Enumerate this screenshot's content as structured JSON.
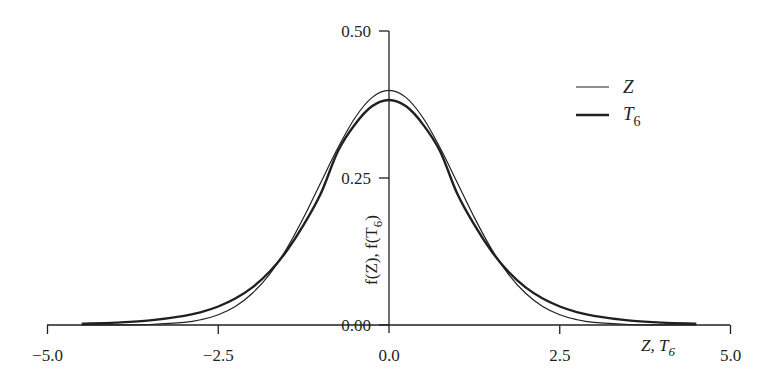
{
  "chart_data": {
    "type": "line",
    "title": "",
    "xlabel": "Z, T6",
    "ylabel": "f(Z), f(T6)",
    "xlim": [
      -5.0,
      5.0
    ],
    "ylim": [
      0.0,
      0.5
    ],
    "grid": false,
    "legend_position": "upper right",
    "x_ticks": [
      "-5.0",
      "-2.5",
      "0.0",
      "2.5",
      "5.0"
    ],
    "y_ticks": [
      "0.00",
      "0.25",
      "0.50"
    ],
    "x": [
      -4.5,
      -4.0,
      -3.5,
      -3.0,
      -2.75,
      -2.5,
      -2.25,
      -2.0,
      -1.75,
      -1.5,
      -1.25,
      -1.0,
      -0.75,
      -0.5,
      -0.25,
      0.0,
      0.25,
      0.5,
      0.75,
      1.0,
      1.25,
      1.5,
      1.75,
      2.0,
      2.25,
      2.5,
      2.75,
      3.0,
      3.5,
      4.0,
      4.5
    ],
    "series": [
      {
        "name": "Z",
        "style": "thin",
        "values": [
          0.0,
          0.0001,
          0.0009,
          0.0044,
          0.0091,
          0.0175,
          0.0317,
          0.054,
          0.0863,
          0.1295,
          0.1826,
          0.242,
          0.3011,
          0.3521,
          0.3867,
          0.3989,
          0.3867,
          0.3521,
          0.3011,
          0.242,
          0.1826,
          0.1295,
          0.0863,
          0.054,
          0.0317,
          0.0175,
          0.0091,
          0.0044,
          0.0009,
          0.0001,
          0.0
        ]
      },
      {
        "name": "T6",
        "style": "thick",
        "values": [
          0.0022,
          0.0041,
          0.0078,
          0.0155,
          0.022,
          0.0315,
          0.045,
          0.064,
          0.0904,
          0.1256,
          0.1702,
          0.2231,
          0.295,
          0.3409,
          0.3719,
          0.3827,
          0.3719,
          0.3409,
          0.295,
          0.2231,
          0.1702,
          0.1256,
          0.0904,
          0.064,
          0.045,
          0.0315,
          0.022,
          0.0155,
          0.0078,
          0.0041,
          0.0022
        ]
      }
    ]
  },
  "axes": {
    "x_ticks": [
      {
        "value": -5.0,
        "label": "−5.0"
      },
      {
        "value": -2.5,
        "label": "−2.5"
      },
      {
        "value": 0.0,
        "label": "0.0"
      },
      {
        "value": 2.5,
        "label": "2.5"
      },
      {
        "value": 5.0,
        "label": "5.0"
      }
    ],
    "y_ticks": [
      {
        "value": 0.0,
        "label": "0.00"
      },
      {
        "value": 0.25,
        "label": "0.25"
      },
      {
        "value": 0.5,
        "label": "0.50"
      }
    ],
    "xlabel_main": "Z, T",
    "xlabel_sub": "6",
    "ylabel_main": "f(Z), f(T",
    "ylabel_sub": "6",
    "ylabel_end": ")"
  },
  "legend": {
    "items": [
      {
        "label": "Z",
        "sub": ""
      },
      {
        "label": "T",
        "sub": "6"
      }
    ]
  },
  "colors": {
    "line": "#231f20",
    "background": "#ffffff"
  }
}
